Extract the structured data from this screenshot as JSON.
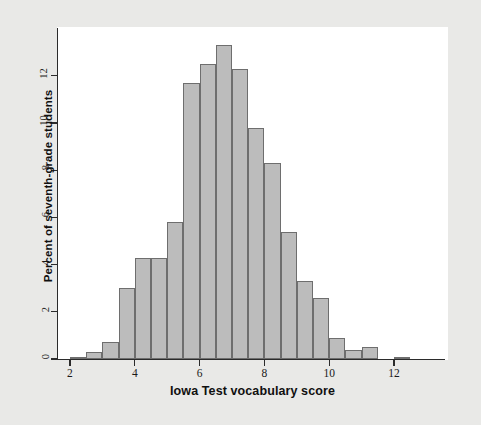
{
  "chart_data": {
    "type": "bar",
    "title": "",
    "xlabel": "Iowa Test vocabulary score",
    "ylabel": "Percent of seventh-grade students",
    "xlim": [
      1.6,
      13.0
    ],
    "ylim": [
      0,
      13.8
    ],
    "xticks": [
      "2",
      "4",
      "6",
      "8",
      "10",
      "12"
    ],
    "xtick_values": [
      2,
      4,
      6,
      8,
      10,
      12
    ],
    "yticks": [
      "0",
      "2",
      "4",
      "6",
      "8",
      "10",
      "12"
    ],
    "ytick_values": [
      0,
      2,
      4,
      6,
      8,
      10,
      12
    ],
    "grid": false,
    "legend": null,
    "bin_width": 0.5,
    "bar_fill": "#bcbcbc",
    "bar_edge": "#6e6e6e",
    "bin_starts": [
      2.0,
      2.5,
      3.0,
      3.5,
      4.0,
      4.5,
      5.0,
      5.5,
      6.0,
      6.5,
      7.0,
      7.5,
      8.0,
      8.5,
      9.0,
      9.5,
      10.0,
      10.5,
      11.0,
      11.5,
      12.0
    ],
    "categories": [
      "2.0-2.5",
      "2.5-3.0",
      "3.0-3.5",
      "3.5-4.0",
      "4.0-4.5",
      "4.5-5.0",
      "5.0-5.5",
      "5.5-6.0",
      "6.0-6.5",
      "6.5-7.0",
      "7.0-7.5",
      "7.5-8.0",
      "8.0-8.5",
      "8.5-9.0",
      "9.0-9.5",
      "9.5-10.0",
      "10.0-10.5",
      "10.5-11.0",
      "11.0-11.5",
      "11.5-12.0",
      "12.0-12.5"
    ],
    "values": [
      0.1,
      0.3,
      0.7,
      3.0,
      4.3,
      4.3,
      5.8,
      11.7,
      12.5,
      13.3,
      12.3,
      9.8,
      8.3,
      5.4,
      3.3,
      2.6,
      0.9,
      0.4,
      0.5,
      0.0,
      0.1
    ]
  },
  "figure": {
    "background": "#e9e9e7",
    "panel_background": "#ffffff",
    "axis_color": "#2b2b2b"
  }
}
